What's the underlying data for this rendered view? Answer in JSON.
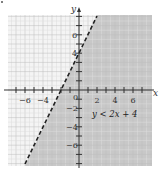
{
  "chart_data": {
    "type": "inequality-graph",
    "title": "",
    "xlabel": "x",
    "ylabel": "y",
    "xlim": [
      -8,
      8
    ],
    "ylim": [
      -8,
      8
    ],
    "grid": true,
    "x_ticks": [
      -6,
      -4,
      2,
      4,
      6
    ],
    "y_ticks": [
      6,
      4,
      -2,
      -4,
      -6
    ],
    "origin_label": "0",
    "boundary": {
      "equation": "y = 2x + 4",
      "slope": 2,
      "intercept": 4,
      "style": "dashed",
      "points": [
        [
          -6,
          -8
        ],
        [
          2,
          8
        ]
      ]
    },
    "shaded_region": "below/right of line",
    "annotation": "y < 2x + 4",
    "colors": {
      "shade": "#c8c8c8",
      "grid": "#d0d0d0",
      "line": "#222222"
    }
  }
}
